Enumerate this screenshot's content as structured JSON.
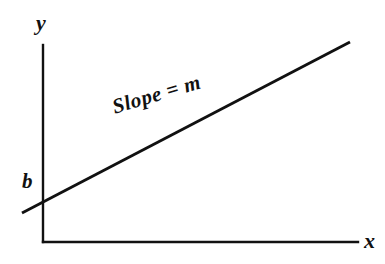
{
  "figure": {
    "kind": "cartesian-line-diagram",
    "background_color": "#ffffff",
    "ink_color": "#111111",
    "width": 385,
    "height": 264
  },
  "labels": {
    "y_axis": "y",
    "x_axis": "x",
    "intercept": "b",
    "slope_annotation": "Slope = m"
  },
  "chart_data": {
    "type": "line",
    "title": "",
    "subtitle": "",
    "xlabel": "x",
    "ylabel": "y",
    "grid": false,
    "legend": null,
    "axes": {
      "x_axis": {
        "label": "x",
        "tick_labels": [],
        "arrow": false,
        "pixel_start": [
          43,
          242
        ],
        "pixel_end": [
          358,
          242
        ]
      },
      "y_axis": {
        "label": "y",
        "tick_labels": [],
        "arrow": false,
        "pixel_start": [
          43,
          45
        ],
        "pixel_end": [
          43,
          242
        ]
      }
    },
    "series": [
      {
        "name": "Slope = m",
        "equation": "y = mx + b",
        "x": [
          22,
          350
        ],
        "y": [
          213,
          42
        ],
        "annotation": "Slope = m",
        "annotation_rotation_deg": -16.5,
        "intercept_label": "b",
        "intercept_pixel": [
          43,
          202
        ]
      }
    ],
    "annotations": [
      {
        "text": "Slope = m",
        "pixel": [
          113,
          108
        ],
        "rotation_deg": -16.5
      },
      {
        "text": "b",
        "pixel": [
          30,
          186
        ],
        "rotation_deg": 0
      },
      {
        "text": "y",
        "pixel": [
          44,
          27
        ],
        "rotation_deg": 0
      },
      {
        "text": "x",
        "pixel": [
          371,
          243
        ],
        "rotation_deg": 0
      }
    ]
  }
}
